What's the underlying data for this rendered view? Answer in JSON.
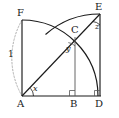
{
  "figure": {
    "type": "geometry-diagram",
    "width": 119,
    "height": 118,
    "background_color": "#ffffff",
    "stroke_color": "#1a1a1a",
    "dashed_stroke_color": "#9a9a9a"
  },
  "points": {
    "A": {
      "label": "A",
      "x": 22,
      "y": 96,
      "label_x": 18,
      "label_y": 99
    },
    "B": {
      "label": "B",
      "x": 75,
      "y": 96,
      "label_x": 71,
      "label_y": 99
    },
    "C": {
      "label": "C",
      "x": 74,
      "y": 36,
      "label_x": 72,
      "label_y": 26
    },
    "D": {
      "label": "D",
      "x": 100,
      "y": 96,
      "label_x": 96,
      "label_y": 99
    },
    "E": {
      "label": "E",
      "x": 100,
      "y": 14,
      "label_x": 96,
      "label_y": 5
    },
    "F": {
      "label": "F",
      "x": 22,
      "y": 20,
      "label_x": 18,
      "label_y": 10
    }
  },
  "angles": [
    {
      "name": "angle-x",
      "label": "x",
      "at": "A",
      "label_x": 33,
      "label_y": 86
    },
    {
      "name": "angle-y",
      "label": "y",
      "at": "C",
      "label_x": 67,
      "label_y": 46
    },
    {
      "name": "angle-z",
      "label": "z",
      "at": "E",
      "label_x": 96,
      "label_y": 24
    }
  ],
  "lengths": [
    {
      "name": "radius-1",
      "label": "1",
      "label_x": 8,
      "label_y": 52
    }
  ],
  "right_angle_marks": [
    {
      "name": "right-angle-B",
      "x": 75,
      "y": 96
    },
    {
      "name": "right-angle-D",
      "x": 100,
      "y": 96
    }
  ],
  "segments": [
    {
      "name": "segment-AF",
      "from": "A",
      "to": "F"
    },
    {
      "name": "segment-FtopEdge",
      "from": "F",
      "to": "arc-start"
    },
    {
      "name": "segment-AD",
      "from": "A",
      "to": "D"
    },
    {
      "name": "segment-AE-diagonal",
      "from": "A",
      "to": "E"
    },
    {
      "name": "segment-CB",
      "from": "C",
      "to": "B"
    },
    {
      "name": "segment-DE",
      "from": "D",
      "to": "E"
    }
  ],
  "arcs": [
    {
      "name": "arc-F-to-D",
      "center": "A",
      "radius": 76,
      "style": "solid",
      "note": "quarter circle from F through C toward D"
    },
    {
      "name": "arc-F-to-A-dashed",
      "center": "A",
      "radius": 76,
      "style": "dashed",
      "note": "dashed continuation of circle left of AF"
    },
    {
      "name": "arc-E-to-D",
      "center": "D",
      "radius": 82,
      "style": "solid",
      "note": "arc from E through C down to D"
    }
  ]
}
